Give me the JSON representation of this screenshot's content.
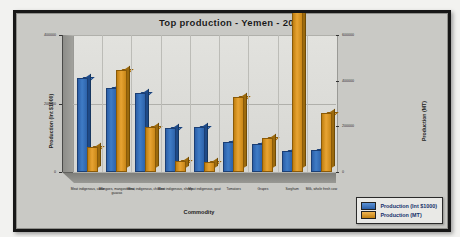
{
  "chart_data": {
    "type": "bar",
    "title": "Top production - Yemen - 2012",
    "xlabel": "Commodity",
    "ylabel": "Production (Int $1000)",
    "ylabel_secondary": "Production (MT)",
    "grid": true,
    "legend_position": "bottom-right",
    "ylim": [
      0,
      400000
    ],
    "yticks": [
      "0",
      "200000",
      "400000"
    ],
    "ylim_secondary": [
      0,
      600000
    ],
    "yticks_secondary": [
      "0",
      "200000",
      "400000",
      "600000"
    ],
    "categories": [
      "Meat indigenous, cattle",
      "Mangoes, mangosteens, guavas",
      "Meat indigenous, chicken",
      "Meat indigenous, sheep",
      "Meat indigenous, goat",
      "Tomatoes",
      "Grapes",
      "Sorghum",
      "Milk, whole fresh cow"
    ],
    "series": [
      {
        "name": "Production (Int $1000)",
        "color": "#3f7cc6",
        "values": [
          268000,
          240000,
          224000,
          124000,
          126000,
          82000,
          76000,
          56000,
          58000
        ]
      },
      {
        "name": "Production (MT)",
        "color": "#e8a433",
        "values": [
          100000,
          440000,
          190000,
          40000,
          36000,
          320000,
          140000,
          700000,
          250000
        ]
      }
    ],
    "legend": [
      {
        "label": "Production (Int $1000)",
        "color": "#3f7cc6"
      },
      {
        "label": "Production (MT)",
        "color": "#e8a433"
      }
    ]
  }
}
